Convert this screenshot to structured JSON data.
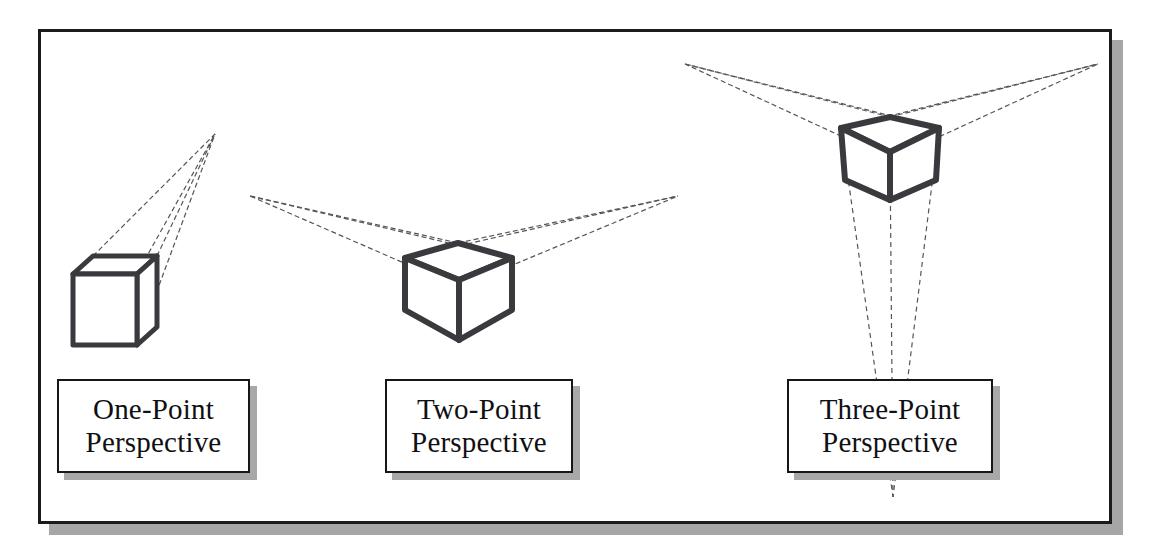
{
  "figure": {
    "title_text_visible": false,
    "background_color": "#ffffff",
    "frame": {
      "name": "outer-frame",
      "x": 38,
      "y": 29,
      "width": 1074,
      "height": 495,
      "border_color": "#1b1b1f",
      "shadow_color": "#a6a6a6"
    },
    "line_colors": {
      "cube_outline": "#3a3a3e",
      "construction_dashed": "#55555a",
      "label_border": "#17171a",
      "label_shadow": "#a8a8a8"
    }
  },
  "panels": [
    {
      "id": "one-point",
      "label_lines": [
        "One-Point",
        "Perspective"
      ],
      "label_box": {
        "x": 57,
        "y": 379,
        "width": 193,
        "height": 94
      },
      "vanishing_points": [
        {
          "name": "vp-center",
          "x": 215,
          "y": 134
        }
      ],
      "cube": {
        "front_face": [
          [
            73,
            274
          ],
          [
            73,
            345
          ],
          [
            137,
            345
          ],
          [
            137,
            274
          ]
        ],
        "top_back_left": [
          93,
          256
        ],
        "top_back_right": [
          157,
          256
        ],
        "right_back_bottom": [
          157,
          327
        ]
      }
    },
    {
      "id": "two-point",
      "label_lines": [
        "Two-Point",
        "Perspective"
      ],
      "label_box": {
        "x": 385,
        "y": 379,
        "width": 188,
        "height": 94
      },
      "vanishing_points": [
        {
          "name": "vp-left",
          "x": 250,
          "y": 196
        },
        {
          "name": "vp-right",
          "x": 678,
          "y": 196
        }
      ],
      "cube": {
        "top_back": [
          458,
          243
        ],
        "top_left": [
          405,
          258
        ],
        "top_right": [
          512,
          258
        ],
        "top_front": [
          459,
          280
        ],
        "bottom_left": [
          405,
          310
        ],
        "bottom_front": [
          459,
          340
        ],
        "bottom_right": [
          512,
          310
        ]
      }
    },
    {
      "id": "three-point",
      "label_lines": [
        "Three-Point",
        "Perspective"
      ],
      "label_box": {
        "x": 787,
        "y": 379,
        "width": 206,
        "height": 94
      },
      "vanishing_points": [
        {
          "name": "vp-left",
          "x": 685,
          "y": 64
        },
        {
          "name": "vp-right",
          "x": 1098,
          "y": 64
        },
        {
          "name": "vp-bottom",
          "x": 893,
          "y": 497
        }
      ],
      "cube": {
        "top_back": [
          890,
          117
        ],
        "top_left": [
          841,
          128
        ],
        "top_right": [
          939,
          128
        ],
        "top_front": [
          890,
          152
        ],
        "bottom_left": [
          845,
          180
        ],
        "bottom_front": [
          890,
          200
        ],
        "bottom_right": [
          936,
          180
        ]
      }
    }
  ]
}
